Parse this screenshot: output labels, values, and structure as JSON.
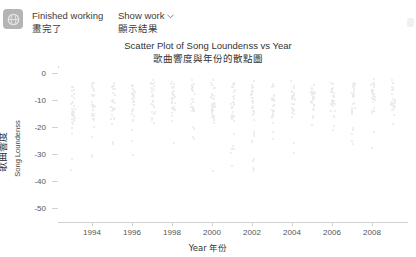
{
  "header": {
    "tool_icon": "globe-icon",
    "status_en": "Finished working",
    "status_zh": "畫完了",
    "show_work_en": "Show work",
    "show_work_zh": "顯示結果",
    "chevron": "⌄"
  },
  "chart_data": {
    "type": "scatter",
    "title": "Scatter Plot of Song Loundenss vs Year",
    "title_zh": "歌曲響度與年份的散點圖",
    "xlabel": "Year  年份",
    "xlabel_en": "Year",
    "xlabel_zh": "年份",
    "ylabel": "Song Loundenss",
    "ylabel_zh": "歌曲響度",
    "xlim": [
      1992.3,
      2009.8
    ],
    "ylim": [
      -55,
      2
    ],
    "xticks": [
      1994,
      1996,
      1998,
      2000,
      2002,
      2004,
      2006,
      2008
    ],
    "yticks": [
      0,
      -10,
      -20,
      -30,
      -40,
      -50
    ],
    "grid": false,
    "legend": null,
    "marker_color": "#e9e9e9",
    "categories": [
      1993,
      1994,
      1995,
      1996,
      1997,
      1998,
      1999,
      2000,
      2001,
      2002,
      2003,
      2004,
      2005,
      2006,
      2007,
      2008,
      2009
    ],
    "series": [
      {
        "name": "songs",
        "points_by_year": [
          {
            "x": 1993,
            "y_min": -36,
            "y_max": -2,
            "y_dense_min": -19,
            "y_dense_max": -4,
            "n": 34
          },
          {
            "x": 1994,
            "y_min": -31,
            "y_max": -2,
            "y_dense_min": -18,
            "y_dense_max": -3,
            "n": 30
          },
          {
            "x": 1995,
            "y_min": -26,
            "y_max": -2,
            "y_dense_min": -17,
            "y_dense_max": -3,
            "n": 26
          },
          {
            "x": 1996,
            "y_min": -30,
            "y_max": -2,
            "y_dense_min": -18,
            "y_dense_max": -3,
            "n": 30
          },
          {
            "x": 1997,
            "y_min": -24,
            "y_max": -2,
            "y_dense_min": -17,
            "y_dense_max": -3,
            "n": 26
          },
          {
            "x": 1998,
            "y_min": -29,
            "y_max": -2,
            "y_dense_min": -18,
            "y_dense_max": -3,
            "n": 30
          },
          {
            "x": 1999,
            "y_min": -24,
            "y_max": -2,
            "y_dense_min": -16,
            "y_dense_max": -3,
            "n": 26
          },
          {
            "x": 2000,
            "y_min": -40,
            "y_max": -2,
            "y_dense_min": -18,
            "y_dense_max": -3,
            "n": 36
          },
          {
            "x": 2001,
            "y_min": -34,
            "y_max": -2,
            "y_dense_min": -17,
            "y_dense_max": -3,
            "n": 32
          },
          {
            "x": 2002,
            "y_min": -37,
            "y_max": -2,
            "y_dense_min": -17,
            "y_dense_max": -3,
            "n": 34
          },
          {
            "x": 2003,
            "y_min": -27,
            "y_max": -2,
            "y_dense_min": -16,
            "y_dense_max": -3,
            "n": 28
          },
          {
            "x": 2004,
            "y_min": -30,
            "y_max": -2,
            "y_dense_min": -16,
            "y_dense_max": -3,
            "n": 30
          },
          {
            "x": 2005,
            "y_min": -23,
            "y_max": -2,
            "y_dense_min": -15,
            "y_dense_max": -3,
            "n": 26
          },
          {
            "x": 2006,
            "y_min": -29,
            "y_max": -2,
            "y_dense_min": -16,
            "y_dense_max": -3,
            "n": 30
          },
          {
            "x": 2007,
            "y_min": -26,
            "y_max": -2,
            "y_dense_min": -15,
            "y_dense_max": -3,
            "n": 28
          },
          {
            "x": 2008,
            "y_min": -28,
            "y_max": -1,
            "y_dense_min": -15,
            "y_dense_max": -3,
            "n": 30
          },
          {
            "x": 2009,
            "y_min": -22,
            "y_max": -2,
            "y_dense_min": -14,
            "y_dense_max": -3,
            "n": 24
          }
        ]
      }
    ]
  }
}
